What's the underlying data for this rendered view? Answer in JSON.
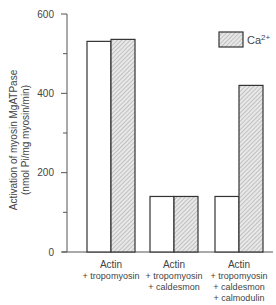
{
  "chart_data": {
    "type": "bar",
    "title": "",
    "xlabel": "",
    "ylabel": "Activation of myosin MgATPase",
    "ylabel_units": "(nmol Pi/mg myosin/min)",
    "ylim": [
      0,
      600
    ],
    "yticks": [
      0,
      200,
      400,
      600
    ],
    "yminor_ticks": [
      100,
      300,
      500
    ],
    "grid": false,
    "legend_position": "top-right",
    "categories": [
      "Actin + tropomyosin",
      "Actin + tropomyosin + caldesmon",
      "Actin + tropomyosin + caldesmon + calmodulin"
    ],
    "category_lines": [
      [
        "Actin",
        "+ tropomyosin"
      ],
      [
        "Actin",
        "+ tropomyosin",
        "+ caldesmon"
      ],
      [
        "Actin",
        "+ tropomyosin",
        "+ caldesmon",
        "+ calmodulin"
      ]
    ],
    "series": [
      {
        "name": "no Ca2+",
        "style": "white",
        "values": [
          531,
          140,
          140
        ]
      },
      {
        "name": "Ca2+",
        "style": "hatched",
        "values": [
          536,
          140,
          420
        ]
      }
    ],
    "legend": [
      {
        "label": "Ca",
        "superscript": "2+",
        "style": "hatched"
      }
    ]
  },
  "axis": {
    "tick_labels": [
      "600",
      "400",
      "200",
      "0"
    ]
  }
}
